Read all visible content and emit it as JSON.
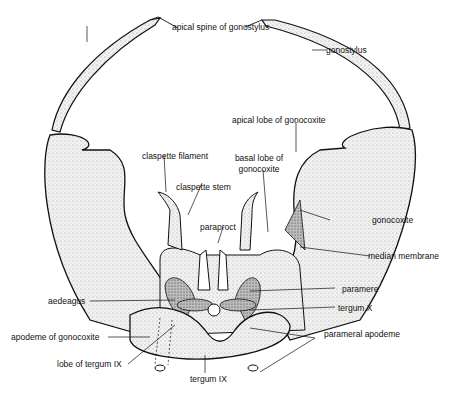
{
  "diagram": {
    "colors": {
      "ink": "#111111",
      "stipple_fill": "#e6e6e6",
      "dark_fill": "#9a9a9a",
      "background": "#ffffff"
    },
    "labels": {
      "apical_spine": "apical spine of gonostylus",
      "gonostylus": "gonostylus",
      "apical_lobe": "apical lobe of gonocoxite",
      "claspette_filament": "claspette filament",
      "basal_lobe_1": "basal lobe of",
      "basal_lobe_2": "gonocoxite",
      "claspette_stem": "claspette stem",
      "gonocoxite": "gonocoxite",
      "paraproct": "paraproct",
      "median_membrane": "median membrane",
      "paramere": "paramere",
      "aedeagus": "aedeagus",
      "tergum_x": "tergum X",
      "apodeme": "apodeme of gonocoxite",
      "parameral_apodeme": "parameral apodeme",
      "lobe_tergum_ix": "lobe of tergum IX",
      "tergum_ix": "tergum IX"
    }
  }
}
